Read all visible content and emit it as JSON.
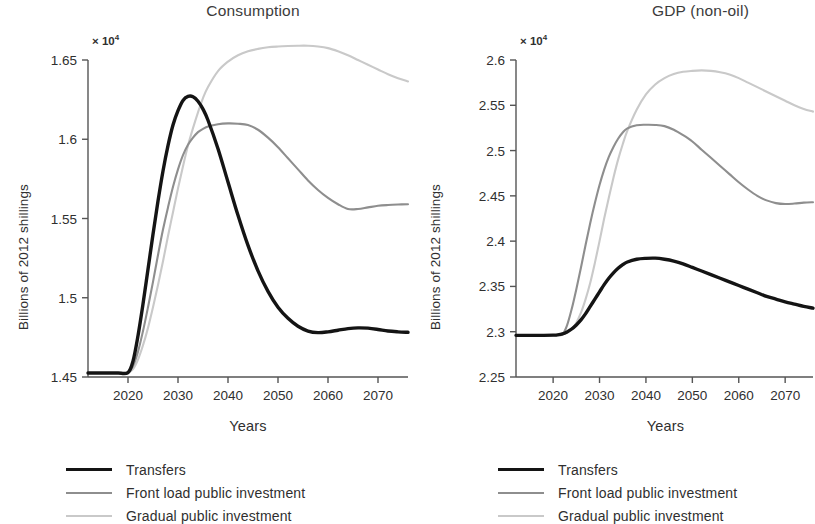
{
  "figure": {
    "width": 815,
    "height": 524,
    "background": "#ffffff"
  },
  "series_styles": [
    {
      "key": "transfers",
      "color": "#141414",
      "width": 3.4
    },
    {
      "key": "front_load",
      "color": "#8e8e8e",
      "width": 2.1
    },
    {
      "key": "gradual",
      "color": "#c9c9c9",
      "width": 2.1
    }
  ],
  "legend": {
    "items": [
      {
        "label": "Transfers",
        "color": "#141414",
        "width": 3.6
      },
      {
        "label": "Front load public investment",
        "color": "#8e8e8e",
        "width": 2.2
      },
      {
        "label": "Gradual public investment",
        "color": "#c9c9c9",
        "width": 2.2
      }
    ]
  },
  "panels": {
    "left": {
      "title": "Consumption",
      "ylabel": "Billions of 2012 shillings",
      "xlabel": "Years",
      "exp_mantissa": "× 10",
      "exp_power": "4"
    },
    "right": {
      "title": "GDP (non-oil)",
      "ylabel": "Billions of 2012 shillings",
      "xlabel": "Years",
      "exp_mantissa": "× 10",
      "exp_power": "4"
    }
  },
  "chart_data": [
    {
      "id": "consumption",
      "type": "line",
      "title": "Consumption",
      "xlabel": "Years",
      "ylabel": "Billions of 2012 shillings",
      "y_scale_factor": 10000,
      "y_scale_label": "× 10^4",
      "xlim": [
        2012,
        2076
      ],
      "ylim": [
        1.45,
        1.65
      ],
      "xticks": [
        2020,
        2030,
        2040,
        2050,
        2060,
        2070
      ],
      "xticklabels": [
        "2020",
        "2030",
        "2040",
        "2050",
        "2060",
        "2070"
      ],
      "yticks": [
        1.45,
        1.5,
        1.55,
        1.6,
        1.65
      ],
      "yticklabels": [
        "1.45",
        "1.5",
        "1.55",
        "1.6",
        "1.65"
      ],
      "grid": false,
      "legend_position": "below",
      "x": [
        2012,
        2014,
        2016,
        2018,
        2020,
        2021,
        2022,
        2023,
        2024,
        2025,
        2026,
        2027,
        2028,
        2029,
        2030,
        2031,
        2032,
        2033,
        2034,
        2035,
        2036,
        2038,
        2040,
        2042,
        2044,
        2046,
        2048,
        2050,
        2052,
        2054,
        2056,
        2058,
        2060,
        2062,
        2064,
        2066,
        2068,
        2070,
        2072,
        2074,
        2076
      ],
      "series": [
        {
          "name": "Transfers",
          "color": "#141414",
          "values": [
            1.4525,
            1.4525,
            1.4525,
            1.4525,
            1.4528,
            1.46,
            1.476,
            1.496,
            1.518,
            1.54,
            1.561,
            1.58,
            1.596,
            1.609,
            1.618,
            1.6245,
            1.627,
            1.6268,
            1.624,
            1.619,
            1.612,
            1.594,
            1.573,
            1.552,
            1.533,
            1.517,
            1.504,
            1.494,
            1.487,
            1.482,
            1.479,
            1.478,
            1.4785,
            1.4795,
            1.4805,
            1.481,
            1.4808,
            1.48,
            1.479,
            1.4785,
            1.4782
          ]
        },
        {
          "name": "Front load public investment",
          "color": "#8e8e8e",
          "values": [
            1.4525,
            1.4525,
            1.4525,
            1.4525,
            1.4528,
            1.457,
            1.466,
            1.479,
            1.494,
            1.51,
            1.527,
            1.543,
            1.557,
            1.57,
            1.581,
            1.59,
            1.5965,
            1.601,
            1.6045,
            1.6065,
            1.608,
            1.6095,
            1.61,
            1.6098,
            1.609,
            1.606,
            1.601,
            1.595,
            1.588,
            1.581,
            1.574,
            1.568,
            1.563,
            1.559,
            1.556,
            1.556,
            1.557,
            1.558,
            1.5585,
            1.5588,
            1.559
          ]
        },
        {
          "name": "Gradual public investment",
          "color": "#c9c9c9",
          "values": [
            1.4525,
            1.4525,
            1.4525,
            1.4525,
            1.4528,
            1.455,
            1.461,
            1.47,
            1.481,
            1.494,
            1.508,
            1.523,
            1.539,
            1.554,
            1.569,
            1.583,
            1.596,
            1.607,
            1.617,
            1.626,
            1.633,
            1.643,
            1.649,
            1.653,
            1.6555,
            1.657,
            1.658,
            1.6585,
            1.6588,
            1.659,
            1.659,
            1.6585,
            1.6575,
            1.6555,
            1.653,
            1.65,
            1.647,
            1.644,
            1.641,
            1.6385,
            1.6365
          ]
        }
      ]
    },
    {
      "id": "gdp_non_oil",
      "type": "line",
      "title": "GDP (non-oil)",
      "xlabel": "Years",
      "ylabel": "Billions of 2012 shillings",
      "y_scale_factor": 10000,
      "y_scale_label": "× 10^4",
      "xlim": [
        2012,
        2076
      ],
      "ylim": [
        2.25,
        2.6
      ],
      "xticks": [
        2020,
        2030,
        2040,
        2050,
        2060,
        2070
      ],
      "xticklabels": [
        "2020",
        "2030",
        "2040",
        "2050",
        "2060",
        "2070"
      ],
      "yticks": [
        2.25,
        2.3,
        2.35,
        2.4,
        2.45,
        2.5,
        2.55,
        2.6
      ],
      "yticklabels": [
        "2.25",
        "2.3",
        "2.35",
        "2.4",
        "2.45",
        "2.5",
        "2.55",
        "2.6"
      ],
      "grid": false,
      "legend_position": "below",
      "x": [
        2012,
        2014,
        2016,
        2018,
        2020,
        2021,
        2022,
        2023,
        2024,
        2025,
        2026,
        2027,
        2028,
        2029,
        2030,
        2031,
        2032,
        2033,
        2034,
        2035,
        2036,
        2038,
        2040,
        2042,
        2044,
        2046,
        2048,
        2050,
        2052,
        2054,
        2056,
        2058,
        2060,
        2062,
        2064,
        2066,
        2068,
        2070,
        2072,
        2074,
        2076
      ],
      "series": [
        {
          "name": "Transfers",
          "color": "#141414",
          "values": [
            2.296,
            2.296,
            2.296,
            2.296,
            2.2962,
            2.2965,
            2.2975,
            2.2998,
            2.303,
            2.3075,
            2.313,
            2.32,
            2.328,
            2.336,
            2.344,
            2.352,
            2.359,
            2.365,
            2.37,
            2.374,
            2.377,
            2.38,
            2.381,
            2.3812,
            2.38,
            2.378,
            2.375,
            2.371,
            2.367,
            2.363,
            2.359,
            2.355,
            2.351,
            2.347,
            2.343,
            2.339,
            2.336,
            2.333,
            2.3305,
            2.328,
            2.326
          ]
        },
        {
          "name": "Front load public investment",
          "color": "#8e8e8e",
          "values": [
            2.296,
            2.296,
            2.296,
            2.296,
            2.2962,
            2.2965,
            2.297,
            2.307,
            2.325,
            2.347,
            2.371,
            2.396,
            2.42,
            2.442,
            2.462,
            2.479,
            2.493,
            2.504,
            2.513,
            2.52,
            2.5245,
            2.528,
            2.5285,
            2.5283,
            2.527,
            2.523,
            2.517,
            2.51,
            2.501,
            2.492,
            2.483,
            2.474,
            2.465,
            2.457,
            2.45,
            2.445,
            2.442,
            2.441,
            2.4415,
            2.4425,
            2.443
          ]
        },
        {
          "name": "Gradual public investment",
          "color": "#c9c9c9",
          "values": [
            2.296,
            2.296,
            2.296,
            2.296,
            2.2962,
            2.2965,
            2.297,
            2.299,
            2.303,
            2.31,
            2.321,
            2.336,
            2.354,
            2.376,
            2.4,
            2.425,
            2.448,
            2.47,
            2.49,
            2.507,
            2.522,
            2.545,
            2.562,
            2.573,
            2.58,
            2.5845,
            2.587,
            2.588,
            2.5885,
            2.588,
            2.5865,
            2.584,
            2.58,
            2.575,
            2.57,
            2.565,
            2.56,
            2.555,
            2.55,
            2.546,
            2.543
          ]
        }
      ]
    }
  ]
}
